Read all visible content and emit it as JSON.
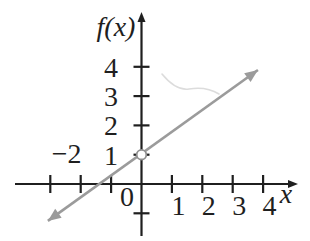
{
  "chart_data": {
    "type": "line",
    "title": "",
    "xlabel": "x",
    "ylabel": "f(x)",
    "grid": false,
    "legend": false,
    "xlim": [
      -4.2,
      5.1
    ],
    "ylim": [
      -1.8,
      5.9
    ],
    "x_axis": {
      "label": "x",
      "ticks": [
        -3,
        -2,
        -1,
        1,
        2,
        3,
        4
      ],
      "labels_below": [
        {
          "value": 1,
          "text": "1"
        },
        {
          "value": 2,
          "text": "2"
        },
        {
          "value": 3,
          "text": "3"
        },
        {
          "value": 4,
          "text": "4"
        }
      ],
      "labels_above": [
        {
          "value": -2,
          "text": "−2"
        }
      ]
    },
    "y_axis": {
      "label": "f(x)",
      "ticks": [
        -1,
        1,
        2,
        3,
        4
      ],
      "labels": [
        {
          "value": 1,
          "text": "1"
        },
        {
          "value": 2,
          "text": "2"
        },
        {
          "value": 3,
          "text": "3"
        },
        {
          "value": 4,
          "text": "4"
        }
      ]
    },
    "origin_label": "0",
    "series": [
      {
        "name": "f(x)",
        "style": "straight-line-arrows-both-ends",
        "color": "#9b9b9b",
        "segment_endpoints": [
          [
            -3.08,
            -1.26
          ],
          [
            3.83,
            3.89
          ]
        ],
        "slope_estimate": 0.67,
        "y_intercept": 1,
        "x_intercept_estimate": -1.5,
        "marked_points": [
          {
            "x": 0,
            "y": 1,
            "marker": "open-circle"
          }
        ]
      }
    ],
    "colors": {
      "axis": "#1f1f1f",
      "labels": "#1f1f1f",
      "line": "#9b9b9b",
      "marker_fill": "#ffffff",
      "marker_stroke": "#8f8f8f",
      "scan_artifact": "#dcdcdc"
    }
  }
}
